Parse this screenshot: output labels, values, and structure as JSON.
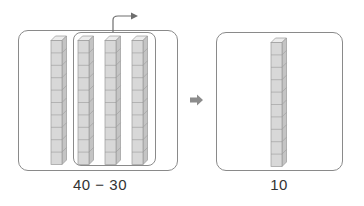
{
  "left_panel": {
    "label": "40 − 30",
    "rods": 4,
    "cubes_per_rod": 10,
    "grouped_rods": 3
  },
  "right_panel": {
    "label": "10",
    "rods": 1,
    "cubes_per_rod": 10
  },
  "arrow": {
    "meaning": "result-arrow"
  },
  "take_away_arrow": {
    "meaning": "remove-group-arrow"
  },
  "colors": {
    "cube_front": "#d8d8d8",
    "cube_side": "#c4c4c4",
    "cube_top": "#ececec",
    "cube_edge": "#9a9a9a",
    "box_border": "#8a8a8a",
    "arrow": "#8c8c8c"
  }
}
